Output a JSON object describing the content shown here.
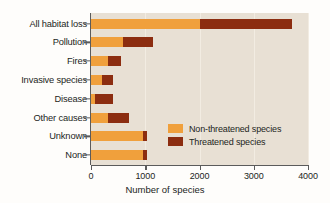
{
  "chart_data": {
    "type": "bar",
    "orientation": "horizontal",
    "stacked": true,
    "title": "",
    "xlabel": "Number of species",
    "ylabel": "",
    "xlim": [
      0,
      4000
    ],
    "xticks": [
      0,
      1000,
      2000,
      3000,
      4000
    ],
    "xtick_labels": [
      "0",
      "1000",
      "2000",
      "3000",
      "4000"
    ],
    "grid": "vertical",
    "legend_position": "inside-lower-right",
    "categories": [
      "All habitat loss",
      "Pollution",
      "Fires",
      "Invasive species",
      "Disease",
      "Other causes",
      "Unknown",
      "None"
    ],
    "series": [
      {
        "name": "Non-threatened species",
        "color": "#f0a03c",
        "values": [
          2000,
          590,
          310,
          200,
          75,
          310,
          960,
          960
        ]
      },
      {
        "name": "Threatened species",
        "color": "#8c2d10",
        "values": [
          1700,
          550,
          240,
          205,
          330,
          390,
          70,
          70
        ]
      }
    ],
    "totals": [
      3700,
      1140,
      550,
      405,
      405,
      700,
      1030,
      1030
    ],
    "colors": {
      "plot_background": "#e8e0d4",
      "figure_background": "#fefdfb",
      "axis": "#5b5b5b",
      "gridline": "#f2ece2",
      "text": "#231f1c"
    }
  },
  "legend": {
    "items": [
      {
        "label": "Non-threatened species",
        "swatch": "nonthreat"
      },
      {
        "label": "Threatened species",
        "swatch": "threat"
      }
    ]
  }
}
